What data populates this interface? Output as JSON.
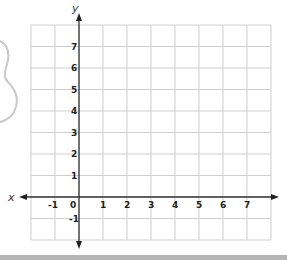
{
  "diagram": {
    "type": "coordinate-grid",
    "x_axis_label": "x",
    "y_axis_label": "y",
    "x_ticks": [
      "-1",
      "0",
      "1",
      "2",
      "3",
      "4",
      "5",
      "6",
      "7"
    ],
    "y_ticks": [
      "7",
      "6",
      "5",
      "4",
      "3",
      "2",
      "1",
      "-1"
    ],
    "x_range": [
      -2,
      8
    ],
    "y_range": [
      -2,
      8
    ],
    "grid_color": "#cfcfcf",
    "axis_color": "#333333"
  },
  "decoration": {
    "partial_shape": "outline of a numeral 8 (cropped at left edge)",
    "color": "#c8c8c8"
  }
}
